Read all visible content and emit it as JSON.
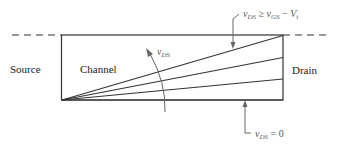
{
  "diagram": {
    "regions": {
      "source": "Source",
      "channel": "Channel",
      "drain": "Drain"
    },
    "annotations": {
      "saturation": {
        "v": "v",
        "sub1": "DS",
        "rel": " ≥ ",
        "v2": "v",
        "sub2": "GS",
        "minus": " − ",
        "V": "V",
        "sub3": "t"
      },
      "zero": {
        "v": "v",
        "sub": "DS",
        "rel": " = 0"
      },
      "sweep": {
        "v": "v",
        "sub": "DS"
      }
    },
    "colors": {
      "line": "#333333",
      "annotation": "#666666"
    }
  }
}
